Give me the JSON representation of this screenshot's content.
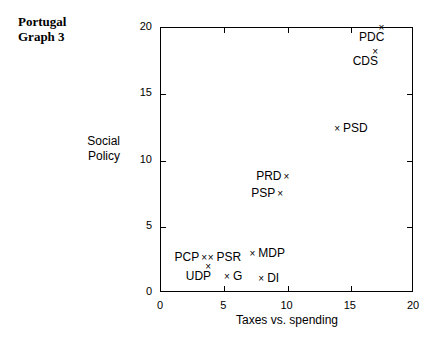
{
  "chart_data": {
    "type": "scatter",
    "title": "Portugal\nGraph 3",
    "xlabel": "Taxes vs. spending",
    "ylabel": "Social\nPolicy",
    "xlim": [
      0,
      20
    ],
    "ylim": [
      0,
      20
    ],
    "xticks": [
      "0",
      "5",
      "10",
      "15",
      "20"
    ],
    "yticks": [
      "0",
      "5",
      "10",
      "15",
      "20"
    ],
    "xtick_values": [
      0,
      5,
      10,
      15,
      20
    ],
    "ytick_values": [
      0,
      5,
      10,
      15,
      20
    ],
    "grid": false,
    "legend": "none",
    "marker": "x",
    "points": [
      {
        "label": "PDC",
        "x": 17.5,
        "y": 19.9,
        "label_pos": "below-left"
      },
      {
        "label": "CDS",
        "x": 17.0,
        "y": 18.1,
        "label_pos": "below-left"
      },
      {
        "label": "PSD",
        "x": 14.0,
        "y": 12.3,
        "label_pos": "right"
      },
      {
        "label": "PRD",
        "x": 10.0,
        "y": 8.7,
        "label_pos": "left"
      },
      {
        "label": "PSP",
        "x": 9.5,
        "y": 7.4,
        "label_pos": "left"
      },
      {
        "label": "MDP",
        "x": 7.3,
        "y": 2.9,
        "label_pos": "right"
      },
      {
        "label": "PSR",
        "x": 4.0,
        "y": 2.6,
        "label_pos": "above-right"
      },
      {
        "label": "PCP",
        "x": 3.5,
        "y": 2.6,
        "label_pos": "above-left"
      },
      {
        "label": "UDP",
        "x": 3.8,
        "y": 1.9,
        "label_pos": "below-left"
      },
      {
        "label": "G",
        "x": 5.3,
        "y": 1.1,
        "label_pos": "right"
      },
      {
        "label": "DI",
        "x": 8.0,
        "y": 1.0,
        "label_pos": "right"
      }
    ]
  }
}
